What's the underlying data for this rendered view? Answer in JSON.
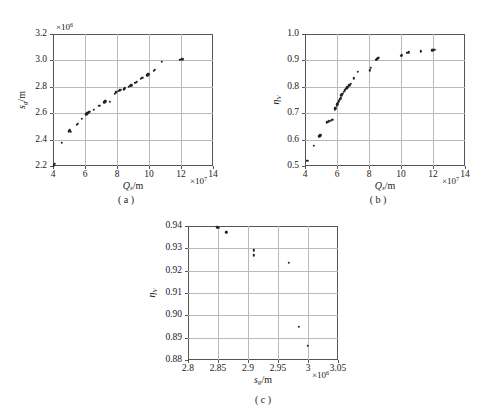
{
  "figure": {
    "panels": [
      {
        "id": "a",
        "caption": "( a )",
        "ylabel_main": "s",
        "ylabel_sub": "g",
        "ylabel_rest": "/m",
        "xlabel_main": "Q",
        "xlabel_sub": "s",
        "xlabel_rest": "/m",
        "y_exponent": "×10",
        "y_exponent_sup": "6",
        "x_exponent": "×10",
        "x_exponent_sup": "7",
        "yticks": [
          "2.2",
          "2.4",
          "2.6",
          "2.8",
          "3.0",
          "3.2"
        ],
        "xticks": [
          "4",
          "6",
          "8",
          "10",
          "12",
          "14"
        ]
      },
      {
        "id": "b",
        "caption": "( b )",
        "ylabel_main": "η",
        "ylabel_sub": "V",
        "ylabel_rest": "",
        "xlabel_main": "Q",
        "xlabel_sub": "s",
        "xlabel_rest": "/m",
        "y_exponent": "",
        "y_exponent_sup": "",
        "x_exponent": "×10",
        "x_exponent_sup": "7",
        "yticks": [
          "0.5",
          "0.6",
          "0.7",
          "0.8",
          "0.9",
          "1.0"
        ],
        "xticks": [
          "4",
          "6",
          "8",
          "10",
          "12",
          "14"
        ]
      },
      {
        "id": "c",
        "caption": "( c )",
        "ylabel_main": "η",
        "ylabel_sub": "V",
        "ylabel_rest": "",
        "xlabel_main": "s",
        "xlabel_sub": "g",
        "xlabel_rest": "/m",
        "y_exponent": "",
        "y_exponent_sup": "",
        "x_exponent": "×10",
        "x_exponent_sup": "6",
        "yticks": [
          "0.88",
          "0.89",
          "0.90",
          "0.91",
          "0.92",
          "0.93",
          "0.94"
        ],
        "xticks": [
          "2.8",
          "2.85",
          "2.9",
          "2.95",
          "3",
          "3.05"
        ]
      }
    ]
  },
  "chart_data": [
    {
      "type": "scatter",
      "panel": "a",
      "title": "( a )",
      "xlabel": "Q_s/m",
      "ylabel": "s_g/m",
      "x_exponent": 10000000.0,
      "y_exponent": 1000000.0,
      "xlim": [
        4,
        14
      ],
      "ylim": [
        2.2,
        3.2
      ],
      "xticks": [
        4,
        6,
        8,
        10,
        12,
        14
      ],
      "yticks": [
        2.2,
        2.4,
        2.6,
        2.8,
        3.0,
        3.2
      ],
      "grid": true,
      "legend": "none",
      "points": [
        [
          4.05,
          2.205
        ],
        [
          4.12,
          2.215
        ],
        [
          4.55,
          2.378
        ],
        [
          5.0,
          2.462
        ],
        [
          5.05,
          2.47
        ],
        [
          5.1,
          2.458
        ],
        [
          5.48,
          2.512
        ],
        [
          5.55,
          2.52
        ],
        [
          5.8,
          2.556
        ],
        [
          6.08,
          2.592
        ],
        [
          6.14,
          2.6
        ],
        [
          6.2,
          2.605
        ],
        [
          6.26,
          2.612
        ],
        [
          6.55,
          2.628
        ],
        [
          6.9,
          2.655
        ],
        [
          7.2,
          2.683
        ],
        [
          7.28,
          2.69
        ],
        [
          7.55,
          2.688
        ],
        [
          7.85,
          2.748
        ],
        [
          7.92,
          2.757
        ],
        [
          7.98,
          2.76
        ],
        [
          8.1,
          2.768
        ],
        [
          8.18,
          2.772
        ],
        [
          8.24,
          2.778
        ],
        [
          8.42,
          2.782
        ],
        [
          8.5,
          2.79
        ],
        [
          8.75,
          2.8
        ],
        [
          8.82,
          2.806
        ],
        [
          8.9,
          2.812
        ],
        [
          9.15,
          2.83
        ],
        [
          9.22,
          2.838
        ],
        [
          9.5,
          2.862
        ],
        [
          9.58,
          2.87
        ],
        [
          9.9,
          2.888
        ],
        [
          9.96,
          2.895
        ],
        [
          10.3,
          2.92
        ],
        [
          10.38,
          2.928
        ],
        [
          10.8,
          2.988
        ],
        [
          11.95,
          3.005
        ],
        [
          12.05,
          3.01
        ],
        [
          12.12,
          3.008
        ]
      ]
    },
    {
      "type": "scatter",
      "panel": "b",
      "title": "( b )",
      "xlabel": "Q_s/m",
      "ylabel": "η_V",
      "x_exponent": 10000000.0,
      "y_exponent": 1,
      "xlim": [
        4,
        14
      ],
      "ylim": [
        0.5,
        1.0
      ],
      "xticks": [
        4,
        6,
        8,
        10,
        12,
        14
      ],
      "yticks": [
        0.5,
        0.6,
        0.7,
        0.8,
        0.9,
        1.0
      ],
      "grid": true,
      "legend": "none",
      "points": [
        [
          4.15,
          0.52
        ],
        [
          4.55,
          0.577
        ],
        [
          4.9,
          0.612
        ],
        [
          4.96,
          0.617
        ],
        [
          5.35,
          0.665
        ],
        [
          5.42,
          0.668
        ],
        [
          5.5,
          0.67
        ],
        [
          5.62,
          0.672
        ],
        [
          5.7,
          0.676
        ],
        [
          5.85,
          0.712
        ],
        [
          5.9,
          0.718
        ],
        [
          5.98,
          0.728
        ],
        [
          6.02,
          0.734
        ],
        [
          6.06,
          0.74
        ],
        [
          6.12,
          0.745
        ],
        [
          6.18,
          0.752
        ],
        [
          6.25,
          0.757
        ],
        [
          6.28,
          0.768
        ],
        [
          6.33,
          0.773
        ],
        [
          6.42,
          0.78
        ],
        [
          6.48,
          0.786
        ],
        [
          6.58,
          0.792
        ],
        [
          6.64,
          0.798
        ],
        [
          6.78,
          0.806
        ],
        [
          6.86,
          0.812
        ],
        [
          7.05,
          0.832
        ],
        [
          7.3,
          0.856
        ],
        [
          8.05,
          0.862
        ],
        [
          8.1,
          0.872
        ],
        [
          8.45,
          0.902
        ],
        [
          8.52,
          0.906
        ],
        [
          8.58,
          0.91
        ],
        [
          10.0,
          0.918
        ],
        [
          10.06,
          0.92
        ],
        [
          10.4,
          0.928
        ],
        [
          10.48,
          0.93
        ],
        [
          11.25,
          0.935
        ],
        [
          11.95,
          0.938
        ],
        [
          12.02,
          0.94
        ],
        [
          12.1,
          0.94
        ]
      ]
    },
    {
      "type": "scatter",
      "panel": "c",
      "title": "( c )",
      "xlabel": "s_g/m",
      "ylabel": "η_V",
      "x_exponent": 1000000.0,
      "y_exponent": 1,
      "xlim": [
        2.8,
        3.05
      ],
      "ylim": [
        0.88,
        0.94
      ],
      "xticks": [
        2.8,
        2.85,
        2.9,
        2.95,
        3.0,
        3.05
      ],
      "yticks": [
        0.88,
        0.89,
        0.9,
        0.91,
        0.92,
        0.93,
        0.94
      ],
      "grid": true,
      "legend": "none",
      "points": [
        [
          2.849,
          0.9395
        ],
        [
          2.851,
          0.9392
        ],
        [
          2.864,
          0.9372
        ],
        [
          2.91,
          0.9292
        ],
        [
          2.91,
          0.9268
        ],
        [
          2.968,
          0.9236
        ],
        [
          2.985,
          0.8948
        ],
        [
          3.0,
          0.8864
        ]
      ]
    }
  ]
}
